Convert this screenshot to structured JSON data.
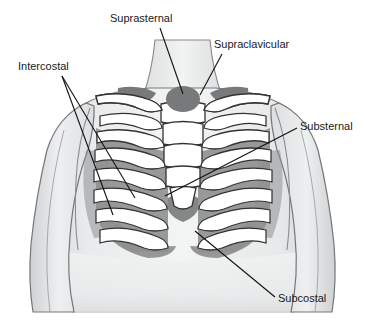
{
  "figure": {
    "background_color": "#ffffff",
    "skin_color": "#eceded",
    "skin_shade_color": "#d9dadb",
    "skin_outline_color": "#6f7274",
    "bone_color": "#ffffff",
    "bone_outline_color": "#333333",
    "retraction_shade_color": "#8d8f90",
    "retraction_dark_color": "#77797a",
    "label_color": "#1a1a1a",
    "leader_color": "#111111"
  },
  "labels": [
    {
      "id": "suprasternal",
      "text": "Suprasternal",
      "x": 110,
      "y": 22,
      "anchor": "start",
      "leader": "M 160 28 L 183 94"
    },
    {
      "id": "supraclavicular",
      "text": "Supraclavicular",
      "x": 214,
      "y": 48,
      "anchor": "start",
      "leader": "M 222 54 L 200 95"
    },
    {
      "id": "intercostal",
      "text": "Intercostal",
      "x": 18,
      "y": 70,
      "anchor": "start",
      "leader_a": "M 62 76 L 135 198",
      "leader_b": "M 62 76 L 113 215"
    },
    {
      "id": "substernal",
      "text": "Substernal",
      "x": 300,
      "y": 130,
      "anchor": "start",
      "leader": "M 297 128 L 165 196"
    },
    {
      "id": "subcostal",
      "text": "Subcostal",
      "x": 278,
      "y": 302,
      "anchor": "start",
      "leader": "M 275 297 L 195 231"
    }
  ],
  "retraction_sites": [
    {
      "id": "suprasternal-notch",
      "label": "Suprasternal",
      "shape": "oval"
    },
    {
      "id": "supraclavicular-left",
      "label": "Supraclavicular",
      "shape": "patch"
    },
    {
      "id": "supraclavicular-right",
      "label": "Supraclavicular",
      "shape": "patch"
    },
    {
      "id": "intercostal-spaces",
      "label": "Intercostal",
      "shape": "stripes"
    },
    {
      "id": "substernal-xiphoid",
      "label": "Substernal",
      "shape": "blob"
    },
    {
      "id": "subcostal-margin",
      "label": "Subcostal",
      "shape": "arc"
    }
  ]
}
